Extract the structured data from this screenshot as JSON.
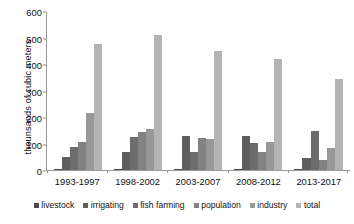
{
  "chart_data": {
    "type": "bar",
    "title": "",
    "subtitle": "",
    "xlabel": "",
    "ylabel": "thounsands of cubic meters",
    "ylim": [
      0,
      600
    ],
    "ytick_values": [
      0,
      100,
      200,
      300,
      400,
      500,
      600
    ],
    "ytick_labels": [
      "0",
      "100",
      "200",
      "300",
      "400",
      "500",
      "600"
    ],
    "grid": false,
    "legend_position": "bottom",
    "categories": [
      "1993-1997",
      "1998-2002",
      "2003-2007",
      "2008-2012",
      "2013-2017"
    ],
    "series": [
      {
        "name": "livestock",
        "color": "#4a4a4a",
        "values": [
          5,
          3,
          2,
          2,
          2
        ]
      },
      {
        "name": "irrigating",
        "color": "#5e5e5e",
        "values": [
          50,
          68,
          128,
          130,
          46
        ]
      },
      {
        "name": "fish farming",
        "color": "#6d6d6d",
        "values": [
          88,
          125,
          68,
          104,
          150
        ]
      },
      {
        "name": "population",
        "color": "#828282",
        "values": [
          105,
          143,
          120,
          70,
          38
        ]
      },
      {
        "name": "industry",
        "color": "#989898",
        "values": [
          215,
          155,
          117,
          107,
          85
        ]
      },
      {
        "name": "total",
        "color": "#b4b4b4",
        "values": [
          480,
          512,
          453,
          420,
          345
        ]
      }
    ]
  },
  "axis": {
    "y_title": "thounsands of cubic meters"
  },
  "colors": {
    "background": "#ffffff",
    "axis_line": "#9a9a9a",
    "text": "#111111"
  }
}
